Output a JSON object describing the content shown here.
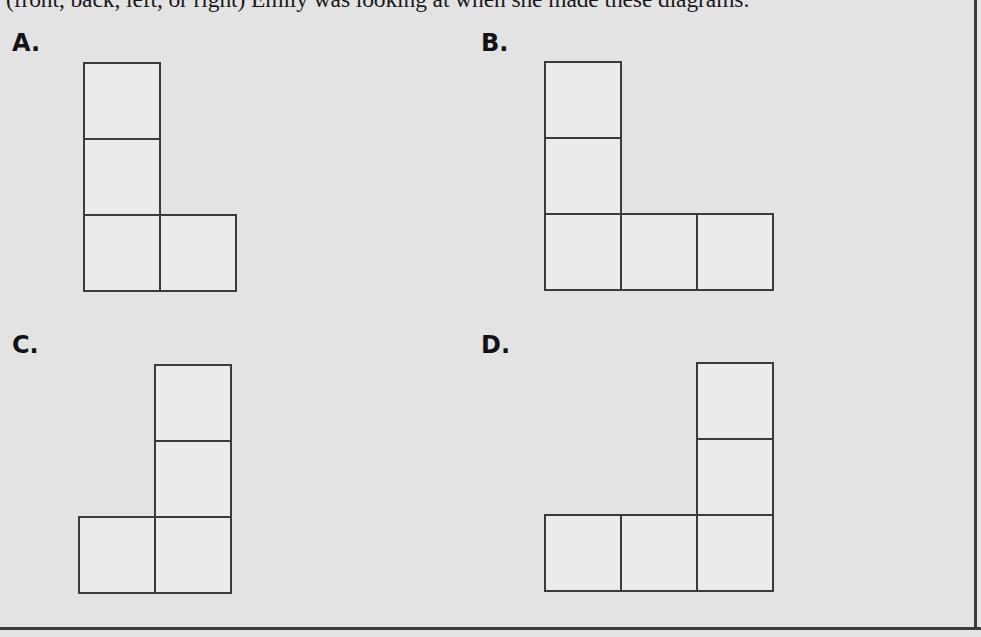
{
  "question": {
    "text": "(front, back, left, or right) Emily was looking at when she made these diagrams:"
  },
  "options": [
    {
      "id": "A",
      "label": "A."
    },
    {
      "id": "B",
      "label": "B."
    },
    {
      "id": "C",
      "label": "C."
    },
    {
      "id": "D",
      "label": "D."
    }
  ],
  "colors": {
    "page_background": "#e4e4e4",
    "square_fill": "#ececec",
    "square_stroke": "#3a3a3e",
    "text": "#17171a",
    "rule": "#3b3b3f"
  },
  "chart_data": {
    "type": "diagram",
    "cell_size_px": 76,
    "diagrams": [
      {
        "id": "A",
        "rows": 3,
        "cols": 2,
        "grid": [
          [
            true,
            false
          ],
          [
            true,
            false
          ],
          [
            true,
            true
          ]
        ],
        "square_count": 4,
        "shape": "L-shape: vertical column of 3 on the left with one square attached right of the bottom"
      },
      {
        "id": "B",
        "rows": 3,
        "cols": 3,
        "grid": [
          [
            true,
            false,
            false
          ],
          [
            true,
            false,
            false
          ],
          [
            true,
            true,
            true
          ]
        ],
        "square_count": 5,
        "shape": "L-shape: vertical column of 3 on the left with a row of 3 along the bottom"
      },
      {
        "id": "C",
        "rows": 3,
        "cols": 2,
        "grid": [
          [
            false,
            true
          ],
          [
            false,
            true
          ],
          [
            true,
            true
          ]
        ],
        "square_count": 4,
        "shape": "Mirrored L-shape: vertical column of 3 on the right with one square attached left of the bottom"
      },
      {
        "id": "D",
        "rows": 3,
        "cols": 3,
        "grid": [
          [
            false,
            false,
            true
          ],
          [
            false,
            false,
            true
          ],
          [
            true,
            true,
            true
          ]
        ],
        "square_count": 5,
        "shape": "Mirrored L-shape: vertical column of 3 on the right with a row of 3 along the bottom"
      }
    ]
  }
}
